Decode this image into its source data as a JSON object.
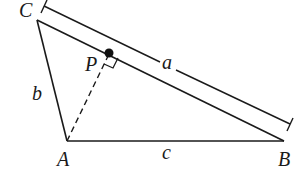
{
  "diagram": {
    "type": "geometry",
    "colors": {
      "stroke": "#1a1a1a",
      "background": "#ffffff"
    },
    "vertices": {
      "A": {
        "label": "A",
        "x": 67,
        "y": 141
      },
      "B": {
        "label": "B",
        "x": 284,
        "y": 141
      },
      "C": {
        "label": "C",
        "x": 37,
        "y": 20
      }
    },
    "point_P": {
      "label": "P",
      "x": 109,
      "y": 53
    },
    "sides": {
      "a": {
        "label": "a",
        "between": "C-B",
        "note": "dimension line drawn parallel to CB"
      },
      "b": {
        "label": "b",
        "between": "C-A"
      },
      "c": {
        "label": "c",
        "between": "A-B"
      }
    },
    "altitude": {
      "from": "A",
      "to": "P",
      "style": "dashed",
      "right_angle_marker": true
    }
  }
}
